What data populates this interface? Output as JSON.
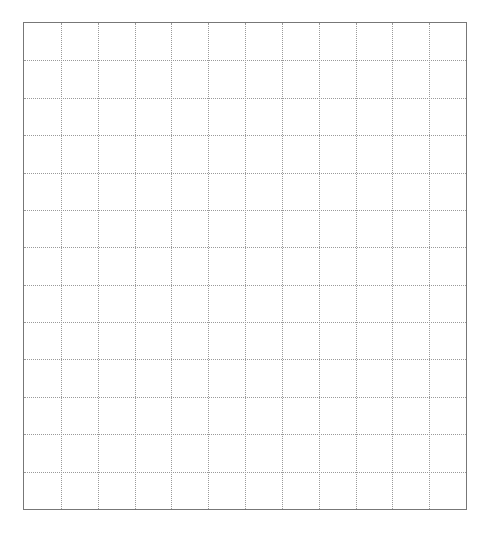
{
  "grid": {
    "columns": 12,
    "rows": 13,
    "border_color": "#777777",
    "line_color": "#9a9a9a",
    "line_style": "dotted",
    "background": "#ffffff"
  }
}
